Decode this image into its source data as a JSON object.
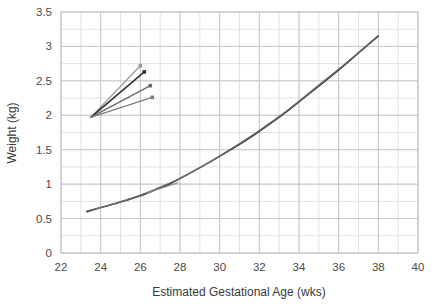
{
  "chart_data": {
    "type": "line",
    "title": "",
    "xlabel": "Estimated Gestational Age (wks)",
    "ylabel": "Weight (kg)",
    "xlim": [
      22,
      40
    ],
    "ylim": [
      0,
      3.5
    ],
    "xticks": [
      22,
      24,
      26,
      28,
      30,
      32,
      34,
      36,
      38,
      40
    ],
    "yticks": [
      0,
      0.5,
      1,
      1.5,
      2,
      2.5,
      3,
      3.5
    ],
    "xtick_labels": [
      "22",
      "24",
      "26",
      "28",
      "30",
      "32",
      "34",
      "36",
      "38",
      "40"
    ],
    "ytick_labels": [
      "0",
      "0.5",
      "1",
      "1.5",
      "2",
      "2.5",
      "3",
      "3.5"
    ],
    "x_minor_step": 1,
    "y_minor_step": 0.25,
    "grid": true,
    "grid_color": "#c8c8cc",
    "minor_grid_color": "#e2e2e6",
    "legend": false,
    "legend_position": "none",
    "series": [
      {
        "name": "growth-curve-main",
        "color": "#3f3f3f",
        "width": 1.6,
        "marker": "none",
        "x": [
          23.3,
          24.0,
          25.0,
          26.0,
          27.0,
          27.6,
          28.5,
          29.5,
          30.5,
          31.4,
          32.5,
          33.5,
          34.5,
          35.5,
          36.5,
          37.3,
          38.0
        ],
        "y": [
          0.6,
          0.66,
          0.74,
          0.83,
          0.95,
          1.02,
          1.16,
          1.32,
          1.49,
          1.65,
          1.87,
          2.08,
          2.31,
          2.54,
          2.78,
          2.98,
          3.15
        ]
      },
      {
        "name": "growth-curve-overlay",
        "color": "#6d6d6d",
        "width": 1.2,
        "marker": "none",
        "x": [
          23.3,
          24.5,
          26.0,
          27.6,
          29.0,
          30.5,
          32.0,
          33.5,
          35.0,
          36.5,
          38.0
        ],
        "y": [
          0.61,
          0.7,
          0.84,
          1.03,
          1.24,
          1.5,
          1.78,
          2.09,
          2.44,
          2.79,
          3.16
        ]
      },
      {
        "name": "fan-line-1",
        "color": "#9a9a9a",
        "width": 1.3,
        "marker": "dot",
        "x": [
          23.5,
          26.0
        ],
        "y": [
          1.97,
          2.72
        ]
      },
      {
        "name": "fan-line-2",
        "color": "#2e2e2e",
        "width": 1.5,
        "marker": "dot",
        "x": [
          23.5,
          26.2
        ],
        "y": [
          1.97,
          2.63
        ]
      },
      {
        "name": "fan-line-3",
        "color": "#6a6a6a",
        "width": 1.3,
        "marker": "dot",
        "x": [
          23.5,
          26.5
        ],
        "y": [
          1.97,
          2.43
        ]
      },
      {
        "name": "fan-line-4",
        "color": "#7d7d7d",
        "width": 1.3,
        "marker": "dot",
        "x": [
          23.5,
          26.6
        ],
        "y": [
          1.97,
          2.26
        ]
      },
      {
        "name": "segment-midcurve",
        "color": "#8a8a8a",
        "width": 1.2,
        "marker": "none",
        "x": [
          26.3,
          27.9
        ],
        "y": [
          0.87,
          1.02
        ]
      }
    ]
  },
  "axes": {
    "y_axis_title": "Weight (kg)",
    "x_axis_title": "Estimated Gestational Age (wks)"
  }
}
